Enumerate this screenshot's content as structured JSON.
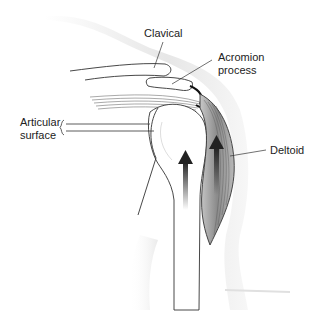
{
  "diagram": {
    "labels": {
      "clavical": "Clavical",
      "acromion_line1": "Acromion",
      "acromion_line2": "process",
      "articular_line1": "Articular",
      "articular_line2": "surface",
      "deltoid": "Deltoid"
    },
    "arrows": [
      {
        "name": "humerus-upward-force",
        "direction": "up"
      },
      {
        "name": "deltoid-contraction",
        "direction": "up"
      }
    ],
    "colors": {
      "line": "#333333",
      "skin_shade": "#d8d8d8",
      "muscle_fill": "#9a9a9a",
      "arrow": "#222222",
      "text": "#222222"
    }
  }
}
